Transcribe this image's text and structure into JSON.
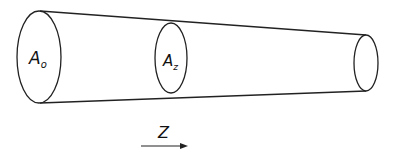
{
  "diagram": {
    "type": "tapered-tube",
    "stroke_color": "#222222",
    "background": "#ffffff",
    "cross_sections": [
      {
        "id": "inlet",
        "label_main": "A",
        "label_sub": "o"
      },
      {
        "id": "middle",
        "label_main": "A",
        "label_sub": "z"
      },
      {
        "id": "outlet",
        "label_main": "",
        "label_sub": ""
      }
    ],
    "axis": {
      "label": "Z",
      "direction": "right"
    }
  }
}
